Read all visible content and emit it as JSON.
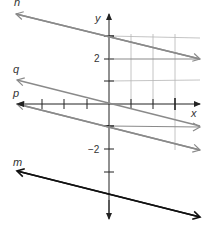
{
  "diagram": {
    "type": "coordinate-plane-lines",
    "axes": {
      "x_label": "x",
      "y_label": "y",
      "x_ticks": [
        -4,
        -3,
        -2,
        -1,
        1,
        2,
        3
      ],
      "y_ticks": [
        3,
        2,
        1,
        -1,
        -2,
        -3
      ],
      "y_tick_labels": [
        {
          "value": 2,
          "text": "2"
        },
        {
          "value": -2,
          "text": "−2"
        }
      ],
      "unit_px": 22.7,
      "origin_px": [
        109,
        104
      ]
    },
    "grid": {
      "vertical_x": [
        1,
        2,
        3
      ],
      "horizontal_y": [
        3,
        2,
        1,
        -1
      ]
    },
    "lines": [
      {
        "name": "n",
        "label": "n",
        "color": "#888888",
        "from": [
          -4.1,
          4
        ],
        "to": [
          4,
          2
        ]
      },
      {
        "name": "q",
        "label": "q",
        "color": "#888888",
        "from": [
          -4,
          1
        ],
        "to": [
          4,
          -1
        ]
      },
      {
        "name": "p",
        "label": "p",
        "color": "#888888",
        "from": [
          -4,
          0
        ],
        "to": [
          4,
          -2
        ]
      },
      {
        "name": "m",
        "label": "m",
        "color": "#111111",
        "from": [
          -4,
          -3
        ],
        "to": [
          4,
          -5
        ]
      }
    ]
  },
  "labels": {
    "n": "n",
    "q": "q",
    "p": "p",
    "m": "m",
    "x_axis": "x",
    "y_axis": "y",
    "tick_2": "2",
    "tick_neg2": "−2"
  }
}
